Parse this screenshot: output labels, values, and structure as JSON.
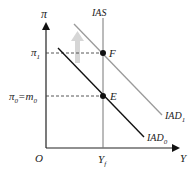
{
  "diagram": {
    "y_axis_label": "π",
    "x_axis_label": "Y",
    "origin_label": "O",
    "ias_label": "IAS",
    "pi1_label": "π",
    "pi1_sub": "1",
    "pi0_label": "π",
    "pi0_sub": "0",
    "pi0_eq": "=m",
    "m0_sub": "0",
    "yf_label": "Y",
    "yf_sub": "f",
    "point_f_label": "F",
    "point_e_label": "E",
    "iad0_label": "IAD",
    "iad0_sub": "0",
    "iad1_label": "IAD",
    "iad1_sub": "1",
    "colors": {
      "axis": "#222222",
      "iad0": "#111111",
      "iad1": "#9a9a9a",
      "shift_arrow": "#d4d4d4",
      "ias": "#777777"
    }
  }
}
